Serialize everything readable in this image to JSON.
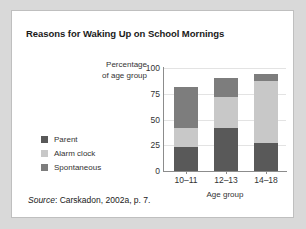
{
  "figure": {
    "title": "Reasons for Waking Up on School Mornings",
    "source_word": "Source",
    "source_text": ": Carskadon, 2002a, p. 7."
  },
  "chart_data": {
    "type": "bar",
    "subtype": "stacked",
    "title": "Reasons for Waking Up on School Mornings",
    "xlabel": "Age group",
    "ylabel": "Percentage of age group",
    "ylabel_line1": "Percentage",
    "ylabel_line2": "of age group",
    "categories": [
      "10–11",
      "12–13",
      "14–18"
    ],
    "ylim": [
      0,
      100
    ],
    "yticks": [
      0,
      25,
      50,
      75,
      100
    ],
    "ytick_labels": [
      "0",
      "25",
      "50",
      "75",
      "100"
    ],
    "grid": true,
    "legend_position": "left",
    "stack_order": [
      "Parent",
      "Alarm clock",
      "Spontaneous"
    ],
    "series": [
      {
        "name": "Parent",
        "color": "#595959",
        "values": [
          23,
          42,
          27
        ]
      },
      {
        "name": "Alarm clock",
        "color": "#c8c8c8",
        "values": [
          19,
          30,
          60
        ]
      },
      {
        "name": "Spontaneous",
        "color": "#7d7d7d",
        "values": [
          40,
          18,
          7
        ]
      }
    ],
    "totals": [
      82,
      90,
      94
    ]
  },
  "colors": {
    "parent": "#595959",
    "alarm_clock": "#c8c8c8",
    "spontaneous": "#7d7d7d",
    "panel_background": "#ffffff",
    "page_background": "#d9d9d9",
    "axis": "#8c8c8c",
    "gridline": "#e3e3e3"
  }
}
